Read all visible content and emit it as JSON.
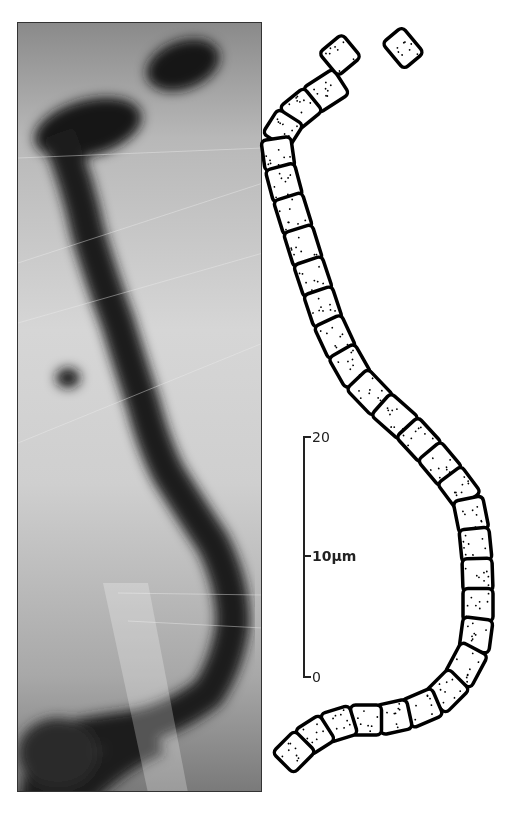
{
  "figure": {
    "panels": [
      {
        "name": "micrograph",
        "description": "grayscale photomicrograph of filament"
      },
      {
        "name": "drawing",
        "description": "line drawing of segmented filament cells"
      }
    ],
    "scale_bar": {
      "unit": "μm",
      "ticks": [
        {
          "label": "20",
          "value": 20
        },
        {
          "label": "10μm",
          "value": 10
        },
        {
          "label": "0",
          "value": 0
        }
      ]
    },
    "filament_path": [
      [
        340,
        82
      ],
      [
        312,
        100
      ],
      [
        290,
        118
      ],
      [
        276,
        140
      ],
      [
        280,
        168
      ],
      [
        288,
        198
      ],
      [
        298,
        230
      ],
      [
        308,
        262
      ],
      [
        318,
        292
      ],
      [
        328,
        322
      ],
      [
        342,
        352
      ],
      [
        358,
        380
      ],
      [
        382,
        405
      ],
      [
        408,
        428
      ],
      [
        430,
        452
      ],
      [
        450,
        476
      ],
      [
        468,
        500
      ],
      [
        474,
        530
      ],
      [
        477,
        560
      ],
      [
        478,
        590
      ],
      [
        478,
        620
      ],
      [
        474,
        650
      ],
      [
        458,
        680
      ],
      [
        436,
        702
      ],
      [
        408,
        714
      ],
      [
        380,
        720
      ],
      [
        352,
        720
      ],
      [
        326,
        728
      ],
      [
        304,
        742
      ],
      [
        284,
        762
      ]
    ],
    "top_fragments": [
      [
        340,
        55
      ],
      [
        403,
        48
      ]
    ]
  }
}
